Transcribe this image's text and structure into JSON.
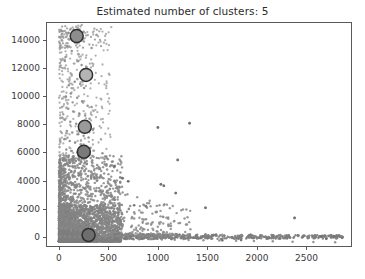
{
  "chart_data": {
    "type": "scatter",
    "title": "Estimated number of clusters: 5",
    "xlabel": "",
    "ylabel": "",
    "xlim": [
      -130,
      2960
    ],
    "ylim": [
      -700,
      15250
    ],
    "grid": false,
    "legend": "none",
    "n_clusters": 5,
    "xticks": [
      0,
      500,
      1000,
      1500,
      2000,
      2500
    ],
    "xtick_labels": [
      "0",
      "500",
      "1000",
      "1500",
      "2000",
      "2500"
    ],
    "yticks": [
      0,
      2000,
      4000,
      6000,
      8000,
      10000,
      12000,
      14000
    ],
    "ytick_labels": [
      "0",
      "2000",
      "4000",
      "6000",
      "8000",
      "10000",
      "12000",
      "14000"
    ],
    "point_color": "#8a8a8a",
    "point_size": 2.0,
    "cluster_edge_color": "#2f2f2f",
    "cluster_marker_size": 13,
    "cluster_centers": [
      {
        "x": 180,
        "y": 14250,
        "fill": "#8d8d8d",
        "label": "cluster-center-1"
      },
      {
        "x": 275,
        "y": 11500,
        "fill": "#b4b4b4",
        "label": "cluster-center-2"
      },
      {
        "x": 262,
        "y": 7820,
        "fill": "#9a9a9a",
        "label": "cluster-center-3"
      },
      {
        "x": 252,
        "y": 6050,
        "fill": "#7a7a7a",
        "label": "cluster-center-4"
      },
      {
        "x": 300,
        "y": 150,
        "fill": "#6e6e6e",
        "label": "cluster-center-5"
      }
    ],
    "series": [
      {
        "name": "samples",
        "color": "#8a8a8a",
        "description": "Dense low-value cloud near origin with long right tail and sparse high-value points.",
        "points_sample": [
          [
            30,
            14620
          ],
          [
            95,
            14480
          ],
          [
            150,
            14700
          ],
          [
            175,
            14300
          ],
          [
            205,
            14180
          ],
          [
            250,
            14560
          ],
          [
            130,
            13200
          ],
          [
            330,
            13400
          ],
          [
            60,
            12480
          ],
          [
            190,
            12460
          ],
          [
            230,
            12200
          ],
          [
            280,
            12050
          ],
          [
            265,
            11560
          ],
          [
            300,
            11480
          ],
          [
            160,
            11020
          ],
          [
            100,
            10760
          ],
          [
            215,
            10850
          ],
          [
            255,
            10580
          ],
          [
            120,
            10180
          ],
          [
            70,
            9960
          ],
          [
            185,
            9880
          ],
          [
            235,
            9620
          ],
          [
            290,
            9320
          ],
          [
            330,
            9220
          ],
          [
            95,
            9100
          ],
          [
            145,
            8900
          ],
          [
            205,
            8760
          ],
          [
            265,
            8620
          ],
          [
            310,
            8400
          ],
          [
            60,
            8320
          ],
          [
            115,
            8180
          ],
          [
            175,
            8040
          ],
          [
            225,
            7960
          ],
          [
            275,
            7880
          ],
          [
            345,
            7640
          ],
          [
            80,
            7520
          ],
          [
            135,
            7420
          ],
          [
            195,
            7300
          ],
          [
            250,
            7180
          ],
          [
            300,
            7060
          ],
          [
            1000,
            7780
          ],
          [
            1320,
            8080
          ],
          [
            55,
            6940
          ],
          [
            110,
            6820
          ],
          [
            165,
            6700
          ],
          [
            220,
            6580
          ],
          [
            270,
            6460
          ],
          [
            320,
            6340
          ],
          [
            75,
            6220
          ],
          [
            130,
            6100
          ],
          [
            185,
            6000
          ],
          [
            240,
            5900
          ],
          [
            295,
            5800
          ],
          [
            350,
            5700
          ],
          [
            440,
            5940
          ],
          [
            1200,
            5470
          ],
          [
            60,
            5600
          ],
          [
            115,
            5500
          ],
          [
            170,
            5400
          ],
          [
            225,
            5300
          ],
          [
            280,
            5180
          ],
          [
            335,
            5080
          ],
          [
            400,
            4980
          ],
          [
            480,
            5060
          ],
          [
            50,
            4880
          ],
          [
            105,
            4780
          ],
          [
            160,
            4680
          ],
          [
            215,
            4580
          ],
          [
            270,
            4480
          ],
          [
            325,
            4380
          ],
          [
            380,
            4280
          ],
          [
            450,
            4180
          ],
          [
            520,
            4060
          ],
          [
            560,
            3980
          ],
          [
            700,
            3960
          ],
          [
            45,
            3880
          ],
          [
            100,
            3780
          ],
          [
            155,
            3680
          ],
          [
            210,
            3580
          ],
          [
            265,
            3480
          ],
          [
            320,
            3380
          ],
          [
            375,
            3280
          ],
          [
            430,
            3200
          ],
          [
            500,
            3120
          ],
          [
            600,
            3380
          ],
          [
            1180,
            3120
          ],
          [
            1030,
            3740
          ],
          [
            1060,
            3640
          ],
          [
            40,
            3000
          ],
          [
            90,
            2940
          ],
          [
            140,
            2880
          ],
          [
            190,
            2820
          ],
          [
            240,
            2760
          ],
          [
            290,
            2700
          ],
          [
            340,
            2640
          ],
          [
            390,
            2560
          ],
          [
            450,
            2480
          ],
          [
            520,
            2400
          ],
          [
            620,
            2300
          ],
          [
            720,
            2200
          ],
          [
            1480,
            2080
          ],
          [
            35,
            2040
          ],
          [
            85,
            1980
          ],
          [
            135,
            1920
          ],
          [
            185,
            1860
          ],
          [
            235,
            1800
          ],
          [
            285,
            1740
          ],
          [
            335,
            1680
          ],
          [
            385,
            1620
          ],
          [
            435,
            1560
          ],
          [
            500,
            1500
          ],
          [
            580,
            1440
          ],
          [
            660,
            1380
          ],
          [
            760,
            1320
          ],
          [
            880,
            1260
          ],
          [
            2380,
            1360
          ],
          [
            30,
            1200
          ],
          [
            80,
            1160
          ],
          [
            130,
            1120
          ],
          [
            180,
            1080
          ],
          [
            230,
            1040
          ],
          [
            280,
            1000
          ],
          [
            330,
            960
          ],
          [
            380,
            920
          ],
          [
            430,
            880
          ],
          [
            490,
            840
          ],
          [
            560,
            800
          ],
          [
            640,
            760
          ],
          [
            730,
            720
          ],
          [
            830,
            680
          ],
          [
            25,
            620
          ],
          [
            70,
            590
          ],
          [
            120,
            560
          ],
          [
            170,
            530
          ],
          [
            220,
            500
          ],
          [
            270,
            470
          ],
          [
            320,
            440
          ],
          [
            370,
            410
          ],
          [
            420,
            380
          ],
          [
            480,
            360
          ],
          [
            550,
            340
          ],
          [
            630,
            320
          ],
          [
            720,
            300
          ],
          [
            820,
            280
          ],
          [
            930,
            260
          ],
          [
            1050,
            240
          ],
          [
            1180,
            220
          ],
          [
            1320,
            200
          ],
          [
            1480,
            180
          ],
          [
            1650,
            160
          ],
          [
            1840,
            140
          ],
          [
            2050,
            120
          ],
          [
            2280,
            100
          ],
          [
            2520,
            80
          ],
          [
            2780,
            60
          ],
          [
            2860,
            40
          ],
          [
            2650,
            30
          ],
          [
            2700,
            20
          ],
          [
            15,
            60
          ],
          [
            60,
            50
          ],
          [
            110,
            40
          ],
          [
            160,
            30
          ],
          [
            210,
            20
          ],
          [
            260,
            10
          ],
          [
            310,
            5
          ],
          [
            360,
            0
          ],
          [
            410,
            -20
          ],
          [
            470,
            -40
          ],
          [
            540,
            -60
          ],
          [
            620,
            -80
          ],
          [
            710,
            -100
          ],
          [
            810,
            -120
          ],
          [
            920,
            -140
          ],
          [
            1040,
            -160
          ],
          [
            1170,
            -180
          ],
          [
            1310,
            -200
          ],
          [
            1460,
            -220
          ],
          [
            1620,
            -240
          ],
          [
            1790,
            -260
          ],
          [
            1970,
            -280
          ],
          [
            2160,
            -300
          ],
          [
            2360,
            -320
          ],
          [
            2570,
            -340
          ],
          [
            2790,
            -360
          ]
        ]
      }
    ]
  }
}
